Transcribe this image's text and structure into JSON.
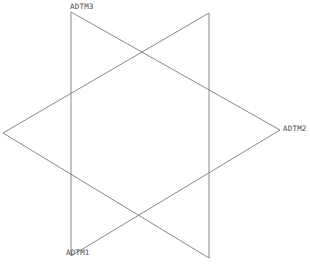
{
  "diagram": {
    "type": "datum-reference-frame",
    "background_color": "#ffffff",
    "line_color": "#7a7a7a",
    "line_width": 0.9,
    "label_color": "#4a4a4a",
    "labels": [
      {
        "id": "adtm3",
        "text": "ADTM3",
        "x": 70,
        "y": 2
      },
      {
        "id": "adtm2",
        "text": "ADTM2",
        "x": 283,
        "y": 124
      },
      {
        "id": "adtm1",
        "text": "ADTM1",
        "x": 66,
        "y": 248
      }
    ],
    "triangles": [
      {
        "id": "triangle-right-pointing",
        "name": "triangle-a",
        "points": "71,12 280,130 71,256"
      },
      {
        "id": "triangle-left-pointing",
        "name": "triangle-b",
        "points": "209,13 209,258 3,133"
      }
    ]
  }
}
